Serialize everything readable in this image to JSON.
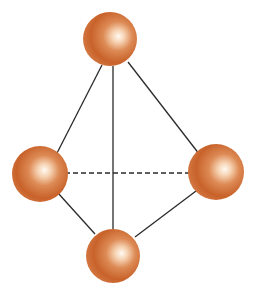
{
  "diagram": {
    "type": "tetrahedral-molecule-model",
    "colors": {
      "background": "#ffffff",
      "sphere_base": "#c8622a",
      "sphere_mid": "#e0925e",
      "sphere_highlight": "#fff8f0",
      "sphere_edge": "#b9541f",
      "edge": "#2a2a2a"
    },
    "nodes": [
      {
        "id": "top",
        "cx": 110,
        "cy": 39,
        "r": 27
      },
      {
        "id": "left",
        "cx": 40,
        "cy": 174,
        "r": 28
      },
      {
        "id": "right",
        "cx": 216,
        "cy": 172,
        "r": 28
      },
      {
        "id": "bottom",
        "cx": 113,
        "cy": 256,
        "r": 27
      }
    ],
    "edges": [
      {
        "from": "top",
        "to": "left",
        "x1": 102,
        "y1": 65,
        "x2": 55,
        "y2": 157,
        "style": "solid"
      },
      {
        "from": "top",
        "to": "bottom",
        "x1": 113,
        "y1": 66,
        "x2": 113,
        "y2": 229,
        "style": "solid"
      },
      {
        "from": "top",
        "to": "right",
        "x1": 128,
        "y1": 62,
        "x2": 203,
        "y2": 159,
        "style": "solid"
      },
      {
        "from": "left",
        "to": "right",
        "x1": 65,
        "y1": 173,
        "x2": 190,
        "y2": 173,
        "style": "dashed"
      },
      {
        "from": "left",
        "to": "bottom",
        "x1": 58,
        "y1": 193,
        "x2": 95,
        "y2": 234,
        "style": "solid"
      },
      {
        "from": "right",
        "to": "bottom",
        "x1": 200,
        "y1": 188,
        "x2": 135,
        "y2": 237,
        "style": "solid"
      }
    ]
  }
}
